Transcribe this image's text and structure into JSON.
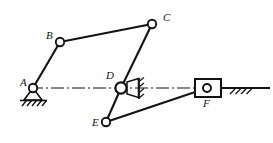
{
  "diagram": {
    "type": "kinematic-linkage-schematic",
    "background_color": "#ffffff",
    "stroke_color": "#121212",
    "joint_fill_color": "#ffffff",
    "canvas": {
      "width": 273,
      "height": 143
    },
    "joints": [
      {
        "id": "A",
        "label": "A",
        "x": 33,
        "y": 88,
        "r": 4.2,
        "kind": "fixed-pivot-ground",
        "label_x": 20,
        "label_y": 86
      },
      {
        "id": "B",
        "label": "B",
        "x": 60,
        "y": 42,
        "r": 4.2,
        "kind": "revolute",
        "label_x": 46,
        "label_y": 39
      },
      {
        "id": "C",
        "label": "C",
        "x": 152,
        "y": 24,
        "r": 4.2,
        "kind": "revolute",
        "label_x": 163,
        "label_y": 21
      },
      {
        "id": "D",
        "label": "D",
        "x": 121,
        "y": 88,
        "r": 5.4,
        "kind": "fixed-pivot-wedge",
        "label_x": 107,
        "label_y": 78
      },
      {
        "id": "E",
        "label": "E",
        "x": 106,
        "y": 122,
        "r": 4.2,
        "kind": "revolute",
        "label_x": 93,
        "label_y": 125
      },
      {
        "id": "F",
        "label": "F",
        "x": 207,
        "y": 88,
        "r": 4.0,
        "kind": "slider-block",
        "label_x": 202,
        "label_y": 104
      }
    ],
    "links": [
      {
        "id": "AB",
        "from": "A",
        "to": "B",
        "label": ""
      },
      {
        "id": "BC",
        "from": "B",
        "to": "C",
        "label": ""
      },
      {
        "id": "CD",
        "from": "C",
        "to": "D",
        "label": ""
      },
      {
        "id": "DE",
        "from": "D",
        "to": "E",
        "label": ""
      },
      {
        "id": "EF",
        "from": "E",
        "to": "F",
        "label": ""
      }
    ],
    "slider": {
      "id": "F",
      "block_x": 195,
      "block_y": 79,
      "block_width": 26,
      "block_height": 18
    },
    "ground_line": {
      "y": 88,
      "x_start": 228,
      "x_end": 270,
      "hatch_count": 4
    },
    "ground_support_A": {
      "triangle_apex_x": 33,
      "triangle_apex_y": 88,
      "base_y": 100,
      "half_width": 9,
      "hatch_line_y": 100,
      "hatch_x_start": 19,
      "hatch_x_end": 47,
      "hatch_count": 5
    },
    "centerline": {
      "style": "dash-dot",
      "y": 88,
      "x_start": 30,
      "x_end": 270
    },
    "wedge_D": {
      "vertical_line_x": 139,
      "vertical_top_y": 78,
      "vertical_bottom_y": 99,
      "hatch_count": 4
    }
  }
}
